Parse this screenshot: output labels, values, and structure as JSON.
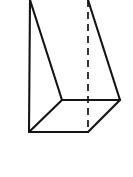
{
  "figure": {
    "canvas": {
      "width": 133,
      "height": 177,
      "background": "#ffffff"
    },
    "style": {
      "solid_line_color": "#141414",
      "hidden_line_color": "#141414",
      "face_color": "#ffffff",
      "solid_line_width": 2.1,
      "hidden_line_width": 1.7,
      "hidden_dash_pattern": "7 5"
    },
    "vertices": {
      "top_front_left": {
        "name": "A",
        "x": 30,
        "y": 0
      },
      "top_back_right": {
        "name": "B",
        "x": 88,
        "y": 0
      },
      "mid_front": {
        "name": "C",
        "x": 62,
        "y": 100
      },
      "mid_right": {
        "name": "D",
        "x": 120,
        "y": 100
      },
      "bottom_left": {
        "name": "E",
        "x": 29,
        "y": 132
      },
      "bottom_center": {
        "name": "F",
        "x": 88,
        "y": 132
      }
    },
    "edges": [
      {
        "name": "left-vertical-edge",
        "from": "top_front_left",
        "to": "bottom_left",
        "visible": true
      },
      {
        "name": "bottom-horizontal-edge",
        "from": "bottom_left",
        "to": "bottom_center",
        "visible": true
      },
      {
        "name": "bottom-right-slant-edge",
        "from": "bottom_center",
        "to": "mid_right",
        "visible": true
      },
      {
        "name": "bottom-left-slant-edge",
        "from": "bottom_left",
        "to": "mid_front",
        "visible": true
      },
      {
        "name": "mid-horizontal-edge",
        "from": "mid_front",
        "to": "mid_right",
        "visible": true
      },
      {
        "name": "left-face-diagonal-edge",
        "from": "top_front_left",
        "to": "mid_front",
        "visible": true
      },
      {
        "name": "right-face-diagonal-edge",
        "from": "top_back_right",
        "to": "mid_right",
        "visible": true
      },
      {
        "name": "hidden-vertical-edge",
        "from": "top_back_right",
        "to": "bottom_center",
        "visible": false
      }
    ]
  }
}
